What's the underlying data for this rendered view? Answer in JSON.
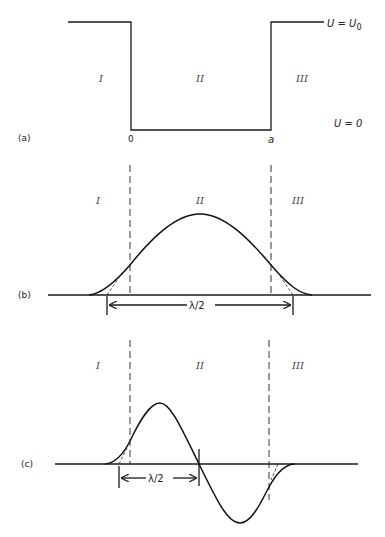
{
  "panels": {
    "a": {
      "label": "(a)",
      "regions": [
        "I",
        "II",
        "III"
      ],
      "x_marks": [
        "0",
        "a"
      ],
      "potential_high": "U = U",
      "potential_high_sub": "0",
      "potential_low": "U = 0"
    },
    "b": {
      "label": "(b)",
      "regions": [
        "I",
        "II",
        "III"
      ],
      "width_label": "λ/2"
    },
    "c": {
      "label": "(c)",
      "regions": [
        "I",
        "II",
        "III"
      ],
      "width_label": "λ/2"
    }
  },
  "colors": {
    "line": "#1a1a1a",
    "background": "#ffffff"
  }
}
